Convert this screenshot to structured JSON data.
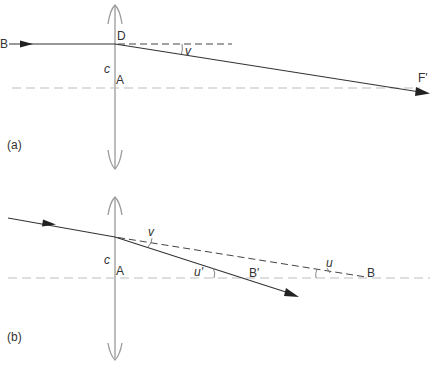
{
  "diagram": {
    "type": "optics-thin-lens-refraction",
    "panels": [
      {
        "id": "a",
        "caption": "(a)",
        "labels": {
          "incoming_point": "B",
          "lens_point": "D",
          "center": "c",
          "axis_point": "A",
          "focus": "F'",
          "angle": "v"
        }
      },
      {
        "id": "b",
        "caption": "(b)",
        "labels": {
          "angle_deviation": "v",
          "center": "c",
          "axis_point": "A",
          "angle_image": "u'",
          "image_point": "B'",
          "angle_object": "u",
          "object_point": "B"
        }
      }
    ],
    "colors": {
      "lens": "#9a9a9a",
      "axis": "#bdbdbd",
      "ray": "#333333",
      "text": "#333333"
    }
  }
}
